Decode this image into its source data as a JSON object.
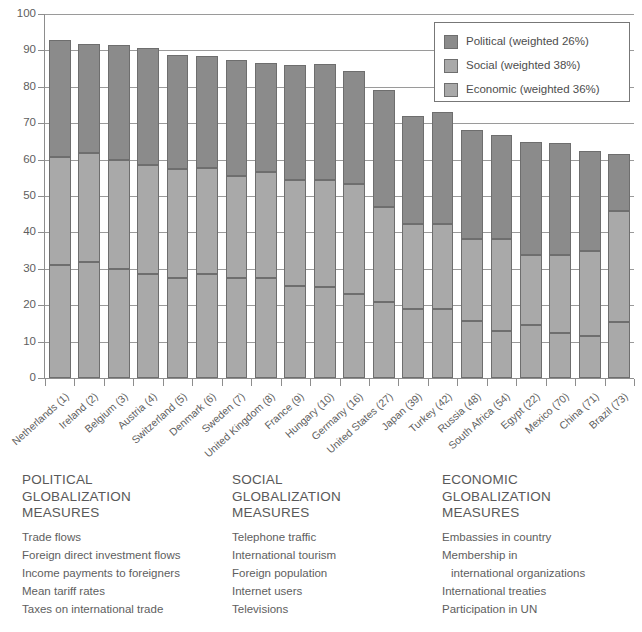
{
  "chart_data": {
    "type": "bar",
    "subtype": "stacked-bar",
    "title": "",
    "xlabel": "",
    "ylabel": "",
    "ylim": [
      0,
      100
    ],
    "ytick_step": 10,
    "yticks": [
      0,
      10,
      20,
      30,
      40,
      50,
      60,
      70,
      80,
      90,
      100
    ],
    "grid": true,
    "grid_axis": "y",
    "legend_position": "top-right",
    "stack_order_bottom_to_top": [
      "Economic",
      "Social",
      "Political"
    ],
    "categories": [
      "Netherlands (1)",
      "Ireland (2)",
      "Belgium (3)",
      "Austria (4)",
      "Switzerland (5)",
      "Denmark (6)",
      "Sweden (7)",
      "United Kingdom (8)",
      "France (9)",
      "Hungary (10)",
      "Germany (16)",
      "United States (27)",
      "Japan (39)",
      "Turkey (42)",
      "Russia (48)",
      "South Africa (54)",
      "Egypt (22)",
      "Mexico (70)",
      "China (71)",
      "Brazil (73)"
    ],
    "series": [
      {
        "name": "Economic (weighted 36%)",
        "color": "#a9a9a9",
        "values": [
          31.0,
          31.8,
          30.0,
          28.7,
          27.6,
          28.6,
          27.4,
          27.4,
          25.3,
          24.9,
          23.2,
          20.8,
          19.0,
          19.0,
          15.8,
          12.8,
          14.6,
          12.5,
          11.6,
          15.5
        ]
      },
      {
        "name": "Social (weighted 38%)",
        "color": "#a9a9a9",
        "values": [
          29.8,
          29.9,
          29.8,
          29.9,
          29.9,
          29.0,
          28.1,
          29.1,
          29.0,
          29.4,
          30.2,
          26.2,
          23.3,
          23.2,
          22.4,
          25.4,
          19.2,
          21.3,
          23.3,
          30.5
        ]
      },
      {
        "name": "Political (weighted 26%)",
        "color": "#8b8b8b",
        "values": [
          32.0,
          30.2,
          31.8,
          32.2,
          31.2,
          31.0,
          31.9,
          30.0,
          31.8,
          32.0,
          31.0,
          32.1,
          29.7,
          30.9,
          29.8,
          28.7,
          31.0,
          30.8,
          27.5,
          15.5
        ]
      }
    ],
    "totals": [
      92.8,
      91.9,
      91.6,
      90.8,
      88.7,
      88.6,
      87.4,
      86.5,
      86.1,
      86.3,
      84.4,
      79.1,
      72.0,
      73.1,
      68.0,
      66.9,
      64.8,
      64.6,
      62.4,
      61.5
    ]
  },
  "legend": {
    "items": [
      {
        "label": "Political (weighted 26%)",
        "color": "#8b8b8b"
      },
      {
        "label": "Social (weighted 38%)",
        "color": "#a9a9a9"
      },
      {
        "label": "Economic (weighted 36%)",
        "color": "#a9a9a9"
      }
    ]
  },
  "measures": {
    "columns": [
      {
        "heading": "POLITICAL\nGLOBALIZATION\nMEASURES",
        "items": [
          {
            "text": "Trade flows",
            "indent": false
          },
          {
            "text": "Foreign direct investment flows",
            "indent": false
          },
          {
            "text": "Income payments to foreigners",
            "indent": false
          },
          {
            "text": "Mean tariff rates",
            "indent": false
          },
          {
            "text": "Taxes on international trade",
            "indent": false
          }
        ]
      },
      {
        "heading": "SOCIAL\nGLOBALIZATION\nMEASURES",
        "items": [
          {
            "text": "Telephone traffic",
            "indent": false
          },
          {
            "text": "International tourism",
            "indent": false
          },
          {
            "text": "Foreign population",
            "indent": false
          },
          {
            "text": "Internet users",
            "indent": false
          },
          {
            "text": "Televisions",
            "indent": false
          }
        ]
      },
      {
        "heading": "ECONOMIC\nGLOBALIZATION\nMEASURES",
        "items": [
          {
            "text": "Embassies in country",
            "indent": false
          },
          {
            "text": "Membership in",
            "indent": false
          },
          {
            "text": "international organizations",
            "indent": true
          },
          {
            "text": "International treaties",
            "indent": false
          },
          {
            "text": "Participation in UN",
            "indent": false
          }
        ]
      }
    ]
  }
}
